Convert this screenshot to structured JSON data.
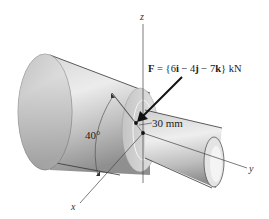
{
  "figure": {
    "type": "stepped-shaft-force-diagram",
    "force_label": {
      "prefix": "F",
      "equals": " = {6",
      "i": "i",
      "minus1": " − 4",
      "j": "j",
      "minus2": " − 7",
      "k": "k",
      "suffix": "} kN",
      "full": "F = {6i − 4j − 7k} kN"
    },
    "force_vector": {
      "i": 6,
      "j": -4,
      "k": -7,
      "unit": "kN"
    },
    "dimension_label": "30 mm",
    "angle_label": "40°",
    "axes": {
      "x": "x",
      "y": "y",
      "z": "z"
    },
    "colors": {
      "background": "#ffffff",
      "shaft_light": "#e6e6e6",
      "shaft_mid": "#bdbdbd",
      "shaft_dark": "#8a8a8a",
      "line": "#333333",
      "arrow": "#111111"
    }
  }
}
